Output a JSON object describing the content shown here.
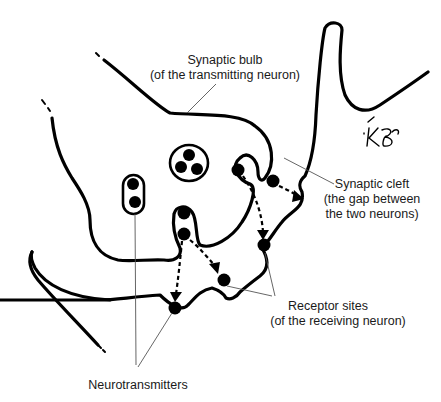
{
  "diagram": {
    "labels": {
      "synaptic_bulb": {
        "line1": "Synaptic bulb",
        "line2": "(of the transmitting neuron)"
      },
      "synaptic_cleft": {
        "line1": "Synaptic cleft",
        "line2": "(the gap between",
        "line3": "the two neurons)"
      },
      "receptor_sites": {
        "line1": "Receptor sites",
        "line2": "(of the receiving neuron)"
      },
      "neurotransmitters": {
        "line1": "Neurotransmitters"
      }
    },
    "signature": "KB",
    "colors": {
      "stroke": "#000000",
      "text": "#1a1a1a",
      "leader": "#555555",
      "background": "#ffffff"
    }
  }
}
